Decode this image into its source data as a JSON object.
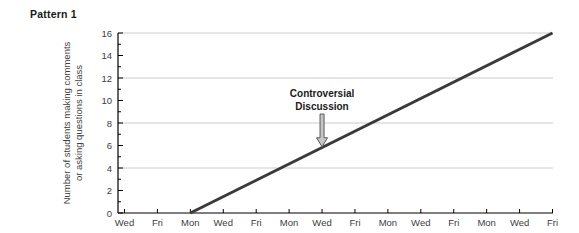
{
  "chart_data": {
    "type": "line",
    "title": "Pattern 1",
    "categories": [
      "Wed",
      "Fri",
      "Mon",
      "Wed",
      "Fri",
      "Mon",
      "Wed",
      "Fri",
      "Mon",
      "Wed",
      "Fri",
      "Mon",
      "Wed",
      "Fri"
    ],
    "xlabel": "",
    "ylabel_lines": [
      "Number of students making comments",
      "or asking questions in class"
    ],
    "ylim": [
      0,
      16
    ],
    "yticks": [
      0,
      2,
      4,
      6,
      8,
      10,
      12,
      14,
      16
    ],
    "minor_yticks": [
      1,
      3,
      5,
      7,
      9,
      11,
      13,
      15
    ],
    "gridlines_at": [
      4,
      8,
      12,
      16
    ],
    "grid": "horizontal only",
    "legend": "none",
    "series": [
      {
        "name": "students participating",
        "points": [
          [
            2,
            0
          ],
          [
            13,
            16
          ]
        ]
      }
    ],
    "annotation": {
      "lines": [
        "Controversial",
        "Discussion"
      ],
      "points_to_category_index": 6,
      "points_to_value": 5.8
    }
  },
  "colors": {
    "line": "#3a3a3a",
    "grid": "#cccccc",
    "axis": "#000000",
    "tick_text": "#3d3d3d",
    "annotation_text": "#1a1a1a",
    "arrow_fill": "#c6c6c6",
    "arrow_stroke": "#5a5a5a"
  }
}
